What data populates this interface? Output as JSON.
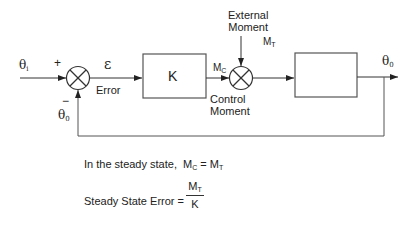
{
  "diagram": {
    "input_label": "θ",
    "input_sub": "i",
    "plus_sign": "+",
    "minus_sign": "−",
    "feedback_label": "θ",
    "feedback_sub": "0",
    "error_symbol": "ε",
    "error_label": "Error",
    "controller_label": "K",
    "control_signal": "M",
    "control_signal_sub": "C",
    "control_label_line1": "Control",
    "control_label_line2": "Moment",
    "disturbance_line1": "External",
    "disturbance_line2": "Moment",
    "disturbance_signal": "M",
    "disturbance_signal_sub": "T",
    "plant_label": "",
    "output_label": "θ",
    "output_sub": "0"
  },
  "equations": {
    "steady_state_prefix": "In the steady state,",
    "steady_lhs": "M",
    "steady_lhs_sub": "C",
    "steady_eq": " = ",
    "steady_rhs": "M",
    "steady_rhs_sub": "T",
    "error_prefix": "Steady State Error =",
    "numerator": "M",
    "numerator_sub": "T",
    "denominator": "K"
  },
  "colors": {
    "line": "#333333",
    "box": "#555555",
    "background": "#ffffff"
  }
}
